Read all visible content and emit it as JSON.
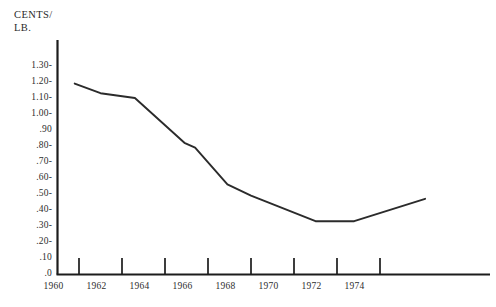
{
  "chart_title_cutoff": "PRICE PER POUND",
  "axis_caption": {
    "line1": "CENTS/",
    "line2": "LB."
  },
  "chart_data": {
    "type": "line",
    "title": "",
    "xlabel": "",
    "ylabel": "CENTS/ LB.",
    "xlim": [
      1960,
      1976.5
    ],
    "ylim": [
      0,
      1.35
    ],
    "grid": false,
    "legend": "none",
    "ytick_labels": [
      "1.30-",
      "1.20-",
      "1.10-",
      "1.00-",
      ".90",
      ".80-",
      ".70-",
      ".60-",
      ".50-",
      ".40-",
      ".30-",
      ".20-",
      ".10",
      ".0"
    ],
    "ytick_values": [
      1.3,
      1.2,
      1.1,
      1.0,
      0.9,
      0.8,
      0.7,
      0.6,
      0.5,
      0.4,
      0.3,
      0.2,
      0.1,
      0.0
    ],
    "xtick_labels": [
      "1960",
      "1962",
      "1964",
      "1966",
      "1968",
      "1970",
      "1972",
      "1974"
    ],
    "xtick_values": [
      1960,
      1962,
      1964,
      1966,
      1968,
      1970,
      1972,
      1974
    ],
    "xtick_marks": [
      1961,
      1963,
      1965,
      1967,
      1969,
      1971,
      1973,
      1975
    ],
    "x": [
      1960.8,
      1962.0,
      1963.6,
      1965.9,
      1966.4,
      1967.9,
      1969.0,
      1972.0,
      1973.8,
      1977.1
    ],
    "values": [
      1.19,
      1.13,
      1.1,
      0.82,
      0.79,
      0.56,
      0.49,
      0.33,
      0.33,
      0.47
    ],
    "series": [
      {
        "name": "Price",
        "values": [
          1.19,
          1.13,
          1.1,
          0.82,
          0.79,
          0.56,
          0.49,
          0.33,
          0.33,
          0.47
        ]
      }
    ]
  },
  "colors": {
    "line": "#2b2b2b",
    "axis": "#1c1c1c",
    "text": "#2d2d2d",
    "background": "#ffffff"
  }
}
